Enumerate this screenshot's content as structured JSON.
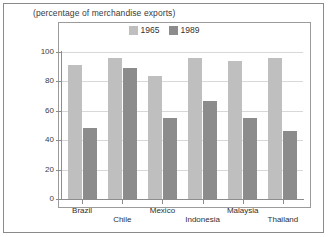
{
  "figure": {
    "subtitle": "(percentage of merchandise exports)"
  },
  "legend": {
    "entries": [
      {
        "label": "1965",
        "color": "#bfbfbf",
        "swatch_name": "legend-swatch-1965"
      },
      {
        "label": "1989",
        "color": "#8c8c8c",
        "swatch_name": "legend-swatch-1989"
      }
    ]
  },
  "chart_data": {
    "type": "bar",
    "title": "",
    "subtitle": "(percentage of merchandise exports)",
    "xlabel": "",
    "ylabel": "",
    "ylim": [
      0,
      100
    ],
    "yticks": [
      0,
      20,
      40,
      60,
      80,
      100
    ],
    "grid": true,
    "legend_position": "top-center",
    "categories": [
      "Brazil",
      "Chile",
      "Mexico",
      "Indonesia",
      "Malaysia",
      "Thailand"
    ],
    "series": [
      {
        "name": "1965",
        "color": "#bfbfbf",
        "values": [
          91,
          96,
          84,
          96,
          94,
          96
        ]
      },
      {
        "name": "1989",
        "color": "#8c8c8c",
        "values": [
          48,
          89,
          55,
          67,
          55,
          46
        ]
      }
    ]
  }
}
